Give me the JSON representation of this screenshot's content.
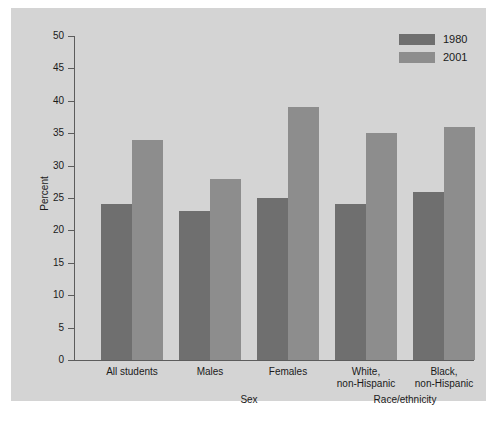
{
  "chart_data": {
    "type": "bar",
    "title": "",
    "subtitle": "",
    "xlabel": "",
    "ylabel": "Percent",
    "ylim": [
      0,
      50
    ],
    "yticks": [
      0,
      5,
      10,
      15,
      20,
      25,
      30,
      35,
      40,
      45,
      50
    ],
    "grid": false,
    "legend_position": "top-right",
    "categories": [
      "All students",
      "Males",
      "Females",
      "White,\nnon-Hispanic",
      "Black,\nnon-Hispanic"
    ],
    "group_labels": [
      {
        "label": "Sex",
        "spans": [
          "Males",
          "Females"
        ]
      },
      {
        "label": "Race/ethnicity",
        "spans": [
          "White, non-Hispanic",
          "Black, non-Hispanic"
        ]
      }
    ],
    "series": [
      {
        "name": "1980",
        "color": "#6f6f6f",
        "values": [
          24,
          23,
          25,
          24,
          26
        ]
      },
      {
        "name": "2001",
        "color": "#8d8d8d",
        "values": [
          34,
          28,
          39,
          35,
          36
        ]
      }
    ]
  },
  "colors": {
    "panel_background": "#d4d4d4",
    "figure_background": "#ffffff",
    "axis": "#5c5c5c",
    "text": "#1a1a1a",
    "series_1980": "#6f6f6f",
    "series_2001": "#8d8d8d"
  }
}
